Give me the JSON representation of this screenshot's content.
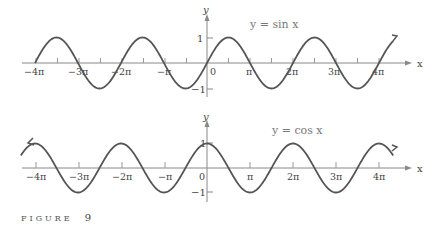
{
  "caption": {
    "label": "FIGURE",
    "number": "9"
  },
  "chart_data": [
    {
      "type": "line",
      "title": "y = sin x",
      "function": "sin",
      "xlabel": "x",
      "ylabel": "y",
      "xlim": [
        -12.566,
        13.6
      ],
      "ylim": [
        -1,
        1
      ],
      "x_ticks": [
        "-4π",
        "-3π",
        "-2π",
        "-π",
        "0",
        "π",
        "2π",
        "3π",
        "4π"
      ],
      "y_ticks": [
        "1",
        "-1"
      ],
      "grid": false,
      "annotations": [
        "curve starts at x = -4π",
        "arrow continues past 4π"
      ],
      "sample_points": {
        "x": [
          "-4π",
          "-7π/2",
          "-3π",
          "-5π/2",
          "-2π",
          "-3π/2",
          "-π",
          "-π/2",
          "0",
          "π/2",
          "π",
          "3π/2",
          "2π",
          "5π/2",
          "3π",
          "7π/2",
          "4π"
        ],
        "y": [
          0,
          1,
          0,
          -1,
          0,
          1,
          0,
          -1,
          0,
          1,
          0,
          -1,
          0,
          1,
          0,
          -1,
          0
        ]
      }
    },
    {
      "type": "line",
      "title": "y = cos x",
      "function": "cos",
      "xlabel": "x",
      "ylabel": "y",
      "xlim": [
        -13.6,
        13.6
      ],
      "ylim": [
        -1,
        1
      ],
      "x_ticks": [
        "-4π",
        "-3π",
        "-2π",
        "-π",
        "0",
        "π",
        "2π",
        "3π",
        "4π"
      ],
      "y_ticks": [
        "1",
        "-1"
      ],
      "grid": false,
      "annotations": [
        "arrows at both ends"
      ],
      "sample_points": {
        "x": [
          "-4π",
          "-7π/2",
          "-3π",
          "-5π/2",
          "-2π",
          "-3π/2",
          "-π",
          "-π/2",
          "0",
          "π/2",
          "π",
          "3π/2",
          "2π",
          "5π/2",
          "3π",
          "7π/2",
          "4π"
        ],
        "y": [
          1,
          0,
          -1,
          0,
          1,
          0,
          -1,
          0,
          1,
          0,
          -1,
          0,
          1,
          0,
          -1,
          0,
          1
        ]
      }
    }
  ],
  "labels": {
    "sin_title": "y = sin x",
    "cos_title": "y = cos x",
    "x_axis": "x",
    "y_axis": "y",
    "ticks": [
      "−4π",
      "−3π",
      "−2π",
      "−π",
      "0",
      "π",
      "2π",
      "3π",
      "4π"
    ],
    "y_one": "1",
    "y_neg_one": "−1"
  }
}
